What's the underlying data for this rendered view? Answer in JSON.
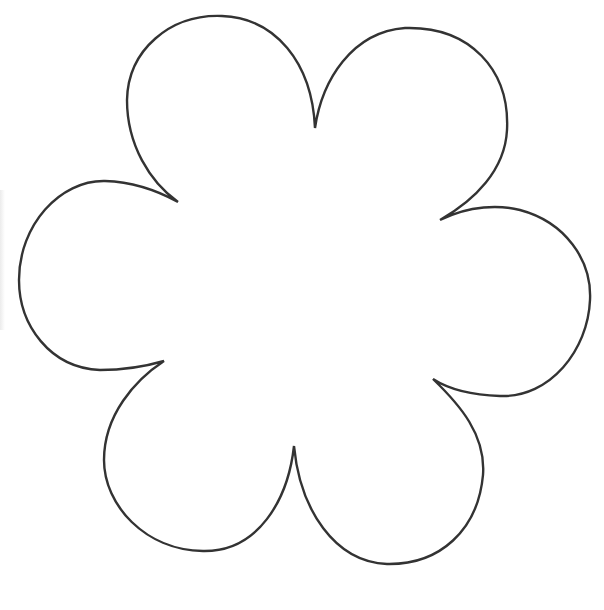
{
  "image": {
    "subject": "flower-outline",
    "petal_count": 6,
    "stroke_color": "#333333",
    "fill_color": "#ffffff",
    "background": "#ffffff"
  }
}
